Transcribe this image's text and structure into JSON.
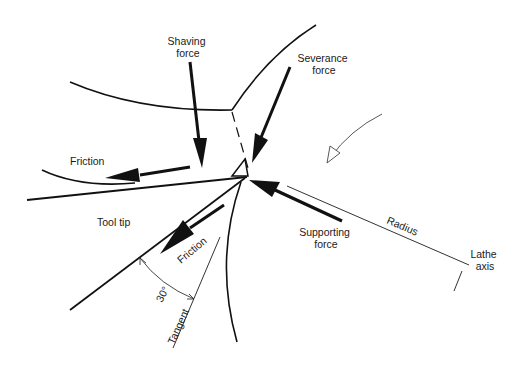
{
  "diagram": {
    "type": "force diagram",
    "colors": {
      "ink": "#111111",
      "thin_ink": "#444444",
      "background": "#ffffff"
    },
    "labels": {
      "shaving_force_line1": "Shaving",
      "shaving_force_line2": "force",
      "severance_force_line1": "Severance",
      "severance_force_line2": "force",
      "friction_top": "Friction",
      "tool_tip": "Tool tip",
      "friction_lower": "Friction",
      "supporting_force_line1": "Supporting",
      "supporting_force_line2": "force",
      "radius": "Radius",
      "lathe_axis_line1": "Lathe",
      "lathe_axis_line2": "axis",
      "angle": "30°",
      "tangent": "Tangent"
    },
    "forces": [
      {
        "name": "Shaving force",
        "direction": "down"
      },
      {
        "name": "Severance force",
        "direction": "down-left"
      },
      {
        "name": "Friction (chip)",
        "direction": "left"
      },
      {
        "name": "Friction (tool)",
        "direction": "down-left"
      },
      {
        "name": "Supporting force",
        "direction": "up-left"
      }
    ],
    "rotation_indicator": "open-head curved arrow (workpiece rotation)",
    "angle_between_tool_and_tangent": "30°"
  }
}
